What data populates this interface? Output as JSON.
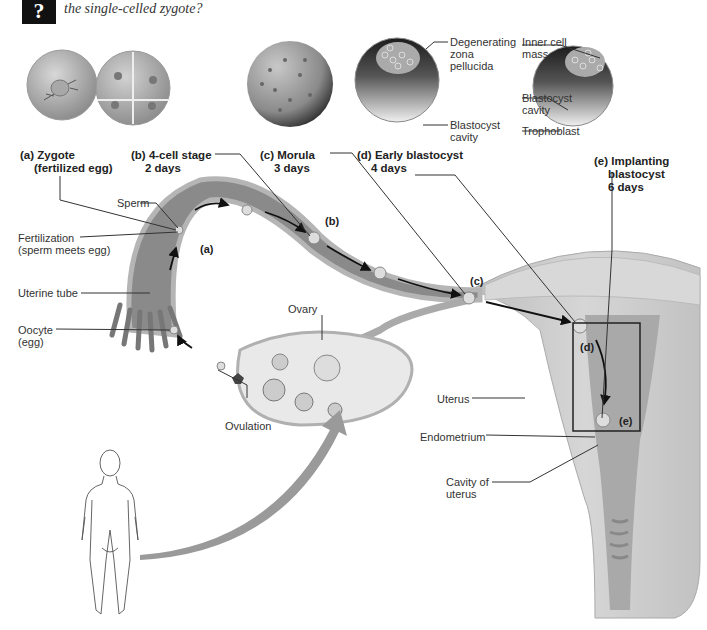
{
  "header": {
    "icon": "question-mark-icon",
    "icon_glyph": "?",
    "question_text": "the single-celled zygote?"
  },
  "stages": [
    {
      "id": "a",
      "title": "(a) Zygote",
      "subtitle": "(fertilized egg)"
    },
    {
      "id": "b",
      "title": "(b) 4-cell stage",
      "subtitle": "2 days"
    },
    {
      "id": "c",
      "title": "(c) Morula",
      "subtitle": "3 days"
    },
    {
      "id": "d",
      "title": "(d) Early blastocyst",
      "subtitle": "4 days"
    },
    {
      "id": "e",
      "title": "(e) Implanting",
      "subtitle": "blastocyst",
      "subtitle2": "6 days"
    }
  ],
  "blastocyst_labels": {
    "degenerating": [
      "Degenerating",
      "zona",
      "pellucida"
    ],
    "d_cavity": [
      "Blastocyst",
      "cavity"
    ],
    "inner_cell_mass": [
      "Inner cell",
      "mass"
    ],
    "e_cavity": [
      "Blastocyst",
      "cavity"
    ],
    "trophoblast": "Trophoblast"
  },
  "anatomy_labels": {
    "sperm": "Sperm",
    "fertilization": [
      "Fertilization",
      "(sperm meets egg)"
    ],
    "uterine_tube": "Uterine tube",
    "oocyte": [
      "Oocyte",
      "(egg)"
    ],
    "ovary": "Ovary",
    "ovulation": "Ovulation",
    "uterus": "Uterus",
    "endometrium": "Endometrium",
    "cavity_of_uterus": [
      "Cavity of",
      "uterus"
    ]
  },
  "path_tags": [
    "(a)",
    "(b)",
    "(c)",
    "(d)",
    "(e)"
  ],
  "colors": {
    "tissue_dark": "#7a7a7a",
    "tissue_light": "#c9c9c9",
    "arrow_gray": "#9a9a9a",
    "line": "#333333"
  }
}
